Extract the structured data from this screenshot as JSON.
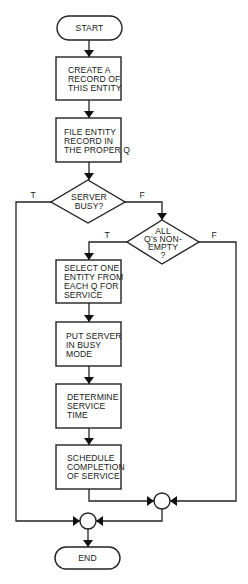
{
  "diagram": {
    "type": "flowchart",
    "colors": {
      "background": "#ffffff",
      "stroke": "#222222",
      "text": "#1a1a1a"
    },
    "nodes": {
      "start": {
        "shape": "terminal",
        "lines": [
          "START"
        ]
      },
      "create_record": {
        "shape": "process",
        "lines": [
          "CREATE  A",
          "RECORD OF",
          "THIS ENTITY"
        ]
      },
      "file_record": {
        "shape": "process",
        "lines": [
          "FILE ENTITY",
          "RECORD IN",
          "THE PROPER Q"
        ]
      },
      "server_busy": {
        "shape": "decision",
        "lines": [
          "SERVER",
          "BUSY?"
        ]
      },
      "all_queues_nonempty": {
        "shape": "decision",
        "lines": [
          "ALL",
          "Q's NON-",
          "EMPTY",
          "?"
        ]
      },
      "select_entity": {
        "shape": "process",
        "lines": [
          "SELECT  ONE",
          "ENTITY FROM",
          "EACH Q FOR",
          "SERVICE"
        ]
      },
      "put_server_busy": {
        "shape": "process",
        "lines": [
          "PUT SERVER",
          "IN  BUSY",
          "MODE"
        ]
      },
      "determine_time": {
        "shape": "process",
        "lines": [
          "DETERMINE",
          "SERVICE",
          "TIME"
        ]
      },
      "schedule_completion": {
        "shape": "process",
        "lines": [
          "SCHEDULE",
          "COMPLETION",
          "OF SERVICE"
        ]
      },
      "junction_1": {
        "shape": "connector",
        "lines": []
      },
      "junction_2": {
        "shape": "connector",
        "lines": []
      },
      "end": {
        "shape": "terminal",
        "lines": [
          "END"
        ]
      }
    },
    "edges": [
      {
        "from": "start",
        "to": "create_record",
        "label": ""
      },
      {
        "from": "create_record",
        "to": "file_record",
        "label": ""
      },
      {
        "from": "file_record",
        "to": "server_busy",
        "label": ""
      },
      {
        "from": "server_busy",
        "to": "junction_2",
        "label": "T"
      },
      {
        "from": "server_busy",
        "to": "all_queues_nonempty",
        "label": "F"
      },
      {
        "from": "all_queues_nonempty",
        "to": "select_entity",
        "label": "T"
      },
      {
        "from": "all_queues_nonempty",
        "to": "junction_1",
        "label": "F"
      },
      {
        "from": "select_entity",
        "to": "put_server_busy",
        "label": ""
      },
      {
        "from": "put_server_busy",
        "to": "determine_time",
        "label": ""
      },
      {
        "from": "determine_time",
        "to": "schedule_completion",
        "label": ""
      },
      {
        "from": "schedule_completion",
        "to": "junction_1",
        "label": ""
      },
      {
        "from": "junction_1",
        "to": "junction_2",
        "label": ""
      },
      {
        "from": "junction_2",
        "to": "end",
        "label": ""
      }
    ],
    "branch_labels": {
      "server_busy_true": "T",
      "server_busy_false": "F",
      "queues_true": "T",
      "queues_false": "F"
    }
  }
}
